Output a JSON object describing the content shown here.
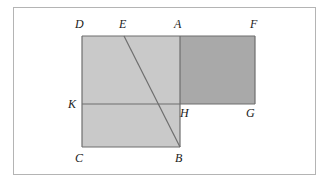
{
  "figure": {
    "background_color": "#ffffff",
    "frame": {
      "border_color": "#b4b4b4",
      "x": 13,
      "y": 7,
      "width": 303,
      "height": 168
    },
    "colors": {
      "light_fill": "#c9c9c9",
      "dark_fill": "#a9a9a9",
      "stroke": "#6e6e6e",
      "line": "#4a4a4a",
      "label": "#1a1a1a"
    },
    "polygons": [
      {
        "name": "light-region-DABC",
        "fill": "#c9c9c9",
        "points": "82,36 180,36 180,147 82,147"
      },
      {
        "name": "dark-region-AFGH",
        "fill": "#a9a9a9",
        "points": "180,36 255,36 255,104 180,104"
      }
    ],
    "segments": [
      {
        "name": "segment-DA-top",
        "x1": 82,
        "y1": 36,
        "x2": 180,
        "y2": 36
      },
      {
        "name": "segment-AF-top",
        "x1": 180,
        "y1": 36,
        "x2": 255,
        "y2": 36
      },
      {
        "name": "segment-DC-left",
        "x1": 82,
        "y1": 36,
        "x2": 82,
        "y2": 147
      },
      {
        "name": "segment-FG-right",
        "x1": 255,
        "y1": 36,
        "x2": 255,
        "y2": 104
      },
      {
        "name": "segment-CB-bottom",
        "x1": 82,
        "y1": 147,
        "x2": 180,
        "y2": 147
      },
      {
        "name": "segment-KG-horizontal",
        "x1": 82,
        "y1": 104,
        "x2": 255,
        "y2": 104
      },
      {
        "name": "segment-AB-vertical",
        "x1": 180,
        "y1": 36,
        "x2": 180,
        "y2": 147
      },
      {
        "name": "segment-EB-diagonal",
        "x1": 124,
        "y1": 36,
        "x2": 180,
        "y2": 147
      }
    ],
    "labels": [
      {
        "name": "vertex-label-D",
        "text": "D",
        "x": 75,
        "y": 18
      },
      {
        "name": "vertex-label-E",
        "text": "E",
        "x": 119,
        "y": 18
      },
      {
        "name": "vertex-label-A",
        "text": "A",
        "x": 174,
        "y": 18
      },
      {
        "name": "vertex-label-F",
        "text": "F",
        "x": 250,
        "y": 18
      },
      {
        "name": "vertex-label-K",
        "text": "K",
        "x": 68,
        "y": 98
      },
      {
        "name": "vertex-label-H",
        "text": "H",
        "x": 180,
        "y": 107
      },
      {
        "name": "vertex-label-G",
        "text": "G",
        "x": 246,
        "y": 107
      },
      {
        "name": "vertex-label-C",
        "text": "C",
        "x": 75,
        "y": 152
      },
      {
        "name": "vertex-label-B",
        "text": "B",
        "x": 175,
        "y": 152
      }
    ]
  }
}
